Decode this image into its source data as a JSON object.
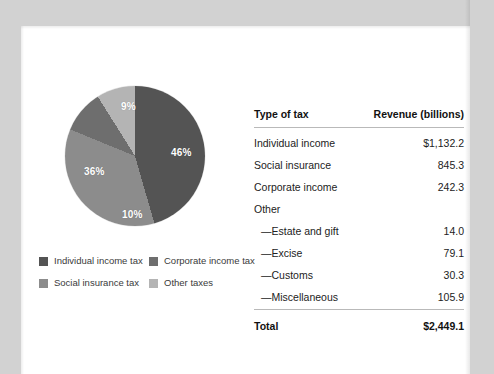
{
  "figure": {
    "pie": {
      "start_angle_deg": 0,
      "slices": [
        {
          "name": "Individual income tax",
          "label": "46%",
          "value": 46,
          "color": "#545454",
          "label_pos": {
            "left": 106,
            "top": 62
          }
        },
        {
          "name": "Social insurance tax",
          "label": "36%",
          "value": 36,
          "color": "#8c8c8c",
          "label_pos": {
            "left": 19,
            "top": 81
          }
        },
        {
          "name": "Corporate income tax",
          "label": "10%",
          "value": 10,
          "color": "#6e6e6e",
          "label_pos": {
            "left": 57,
            "top": 124
          }
        },
        {
          "name": "Other taxes",
          "label": "9%",
          "value": 9,
          "color": "#b4b4b4",
          "label_pos": {
            "left": 56,
            "top": 16
          }
        }
      ]
    },
    "legend": [
      {
        "label": "Individual income tax",
        "color": "#545454"
      },
      {
        "label": "Corporate income tax",
        "color": "#6e6e6e"
      },
      {
        "label": "Social insurance tax",
        "color": "#8c8c8c"
      },
      {
        "label": "Other taxes",
        "color": "#b4b4b4"
      }
    ]
  },
  "table": {
    "columns": [
      "Type of tax",
      "Revenue (billions)"
    ],
    "rows": [
      {
        "label": "Individual income",
        "value": "$1,132.2",
        "sub": false
      },
      {
        "label": "Social insurance",
        "value": "845.3",
        "sub": false
      },
      {
        "label": "Corporate income",
        "value": "242.3",
        "sub": false
      },
      {
        "label": "Other",
        "value": "",
        "sub": false
      },
      {
        "label": "—Estate and gift",
        "value": "14.0",
        "sub": true
      },
      {
        "label": "—Excise",
        "value": "79.1",
        "sub": true
      },
      {
        "label": "—Customs",
        "value": "30.3",
        "sub": true
      },
      {
        "label": "—Miscellaneous",
        "value": "105.9",
        "sub": true
      }
    ],
    "total": {
      "label": "Total",
      "value": "$2,449.1"
    }
  },
  "chart_data": {
    "type": "pie",
    "title": "",
    "categories": [
      "Individual income tax",
      "Corporate income tax",
      "Social insurance tax",
      "Other taxes"
    ],
    "values": [
      46,
      10,
      36,
      9
    ],
    "value_unit": "percent",
    "data_labels": [
      "46%",
      "10%",
      "36%",
      "9%"
    ],
    "colors": [
      "#545454",
      "#6e6e6e",
      "#8c8c8c",
      "#b4b4b4"
    ],
    "legend_position": "bottom",
    "start_angle_deg": 0,
    "direction": "clockwise",
    "source_table": {
      "columns": [
        "Type of tax",
        "Revenue (billions)"
      ],
      "rows": [
        [
          "Individual income",
          "$1,132.2"
        ],
        [
          "Social insurance",
          "845.3"
        ],
        [
          "Corporate income",
          "242.3"
        ],
        [
          "Other",
          ""
        ],
        [
          "—Estate and gift",
          "14.0"
        ],
        [
          "—Excise",
          "79.1"
        ],
        [
          "—Customs",
          "30.3"
        ],
        [
          "—Miscellaneous",
          "105.9"
        ],
        [
          "Total",
          "$2,449.1"
        ]
      ]
    }
  }
}
